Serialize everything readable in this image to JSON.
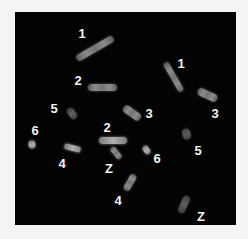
{
  "figure": {
    "background_color": "#030303",
    "frame_color": "#f4f4f4",
    "label_color": "#f2f2f2"
  },
  "labels": [
    {
      "text": "1",
      "x": 67,
      "y": 21
    },
    {
      "text": "2",
      "x": 63,
      "y": 68
    },
    {
      "text": "1",
      "x": 166,
      "y": 51
    },
    {
      "text": "3",
      "x": 200,
      "y": 101
    },
    {
      "text": "5",
      "x": 39,
      "y": 96
    },
    {
      "text": "3",
      "x": 134,
      "y": 101
    },
    {
      "text": "6",
      "x": 20,
      "y": 118
    },
    {
      "text": "2",
      "x": 92,
      "y": 115
    },
    {
      "text": "5",
      "x": 183,
      "y": 138
    },
    {
      "text": "4",
      "x": 47,
      "y": 151
    },
    {
      "text": "Z",
      "x": 94,
      "y": 156
    },
    {
      "text": "6",
      "x": 142,
      "y": 146
    },
    {
      "text": "4",
      "x": 103,
      "y": 188
    },
    {
      "text": "Z",
      "x": 186,
      "y": 204
    }
  ],
  "chromosomes": [
    {
      "id": "1a",
      "pair": "1",
      "cx": 80,
      "cy": 36,
      "length": 42,
      "thickness": 7,
      "angle": -30,
      "tone": "normal"
    },
    {
      "id": "2a",
      "pair": "2",
      "cx": 87,
      "cy": 75,
      "length": 29,
      "thickness": 7,
      "angle": 0,
      "tone": "normal"
    },
    {
      "id": "1b",
      "pair": "1",
      "cx": 158,
      "cy": 65,
      "length": 33,
      "thickness": 6,
      "angle": 60,
      "tone": "normal"
    },
    {
      "id": "3b",
      "pair": "3",
      "cx": 192,
      "cy": 83,
      "length": 21,
      "thickness": 8,
      "angle": 25,
      "tone": "normal"
    },
    {
      "id": "5a",
      "pair": "5",
      "cx": 57,
      "cy": 101,
      "length": 12,
      "thickness": 7,
      "angle": 55,
      "tone": "dim"
    },
    {
      "id": "3a",
      "pair": "3",
      "cx": 117,
      "cy": 101,
      "length": 20,
      "thickness": 8,
      "angle": 35,
      "tone": "normal"
    },
    {
      "id": "6a",
      "pair": "6",
      "cx": 17,
      "cy": 132,
      "length": 8,
      "thickness": 7,
      "angle": 80,
      "tone": "bright"
    },
    {
      "id": "2b",
      "pair": "2",
      "cx": 98,
      "cy": 128,
      "length": 28,
      "thickness": 7,
      "angle": 0,
      "tone": "bright"
    },
    {
      "id": "5b",
      "pair": "5",
      "cx": 171,
      "cy": 122,
      "length": 11,
      "thickness": 8,
      "angle": 75,
      "tone": "dim"
    },
    {
      "id": "4a",
      "pair": "4",
      "cx": 57,
      "cy": 136,
      "length": 17,
      "thickness": 6,
      "angle": 15,
      "tone": "bright"
    },
    {
      "id": "Z1",
      "pair": "Z",
      "cx": 101,
      "cy": 141,
      "length": 14,
      "thickness": 6,
      "angle": 50,
      "tone": "normal"
    },
    {
      "id": "6b",
      "pair": "6",
      "cx": 131,
      "cy": 138,
      "length": 9,
      "thickness": 6,
      "angle": 55,
      "tone": "bright"
    },
    {
      "id": "4b",
      "pair": "4",
      "cx": 115,
      "cy": 170,
      "length": 18,
      "thickness": 7,
      "angle": -60,
      "tone": "normal"
    },
    {
      "id": "Z2",
      "pair": "Z",
      "cx": 169,
      "cy": 192,
      "length": 18,
      "thickness": 7,
      "angle": -65,
      "tone": "dim"
    }
  ]
}
